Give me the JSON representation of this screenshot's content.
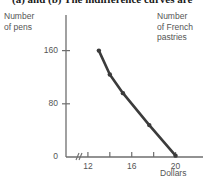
{
  "figure": {
    "caption": "(a) and (b)  The indifference curves are",
    "y_axis_title": "Number\nof pens",
    "right_axis_title": "Number\nof French\npastries",
    "x_axis_title": "Dollars"
  },
  "colors": {
    "line": "#3b3b3b",
    "axis": "#6e6e6e",
    "text": "#555555",
    "caption": "#1a1a1a",
    "background": "#ffffff"
  },
  "chart_data": {
    "type": "line",
    "title": "",
    "xlabel": "Dollars",
    "ylabel": "Number of pens",
    "secondary_ylabel": "Number of French pastries",
    "xlim": [
      10,
      21.5
    ],
    "ylim": [
      0,
      185
    ],
    "grid": false,
    "legend": null,
    "axis_break_x": true,
    "x_ticks": [
      12,
      14,
      16,
      18,
      20
    ],
    "x_tick_labels": [
      "12",
      "",
      "16",
      "",
      "20"
    ],
    "y_ticks": [
      0,
      80,
      160
    ],
    "y_tick_labels": [
      "0",
      "80",
      "160"
    ],
    "series": [
      {
        "name": "Budget line",
        "marker": "dot",
        "x": [
          13.0,
          14.0,
          15.2,
          17.6,
          20.0
        ],
        "y": [
          160,
          124,
          96,
          48,
          2
        ]
      }
    ]
  }
}
